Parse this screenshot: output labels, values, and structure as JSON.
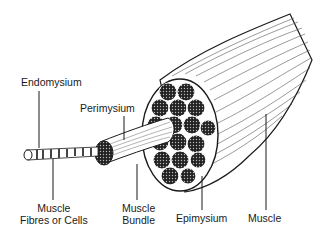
{
  "diagram": {
    "labels": {
      "endomysium": "Endomysium",
      "perimysium": "Perimysium",
      "fibres_line1": "Muscle",
      "fibres_line2": "Fibres or Cells",
      "bundle_line1": "Muscle",
      "bundle_line2": "Bundle",
      "epimysium": "Epimysium",
      "muscle": "Muscle"
    },
    "colors": {
      "ink": "#1a1a1a",
      "background": "#ffffff",
      "fill_dark": "#333333"
    }
  }
}
